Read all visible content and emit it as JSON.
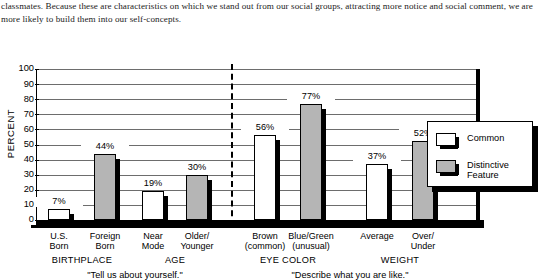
{
  "body_text": "classmates. Because these are characteristics on which we stand out from our social groups, attracting more notice and social comment, we are more likely to build them into our self-concepts.",
  "chart_data": {
    "type": "bar",
    "title": "",
    "xlabel": "",
    "ylabel": "PERCENT",
    "ylim": [
      0,
      100
    ],
    "ytick_labels": [
      "100",
      "90",
      "80",
      "70",
      "60",
      "50",
      "40",
      "30",
      "20",
      "10",
      "0"
    ],
    "grid": true,
    "legend_position": "right",
    "categories": [
      "U.S.\nBorn",
      "Foreign\nBorn",
      "Near\nMode",
      "Older/\nYounger",
      "Brown\n(common)",
      "Blue/Green\n(unusual)",
      "Average",
      "Over/\nUnder"
    ],
    "values": [
      7,
      44,
      19,
      30,
      56,
      77,
      37,
      52
    ],
    "value_labels": [
      "7%",
      "44%",
      "19%",
      "30%",
      "56%",
      "77%",
      "37%",
      "52%"
    ],
    "bar_types": [
      "common",
      "distinct",
      "common",
      "distinct",
      "common",
      "distinct",
      "common",
      "distinct"
    ],
    "groups": [
      {
        "label": "BIRTHPLACE",
        "categories": [
          "U.S. Born",
          "Foreign Born"
        ]
      },
      {
        "label": "AGE",
        "categories": [
          "Near Mode",
          "Older/ Younger"
        ]
      },
      {
        "label": "EYE COLOR",
        "categories": [
          "Brown (common)",
          "Blue/Green (unusual)"
        ]
      },
      {
        "label": "WEIGHT",
        "categories": [
          "Average",
          "Over/ Under"
        ]
      }
    ],
    "sections": [
      {
        "quote": "\"Tell us about yourself.\"",
        "groups": [
          "BIRTHPLACE",
          "AGE"
        ]
      },
      {
        "quote": "\"Describe what you are like.\"",
        "groups": [
          "EYE COLOR",
          "WEIGHT"
        ]
      }
    ],
    "legend": [
      {
        "label": "Common",
        "swatch": "common",
        "color": "#ffffff"
      },
      {
        "label": "Distinctive\nFeature",
        "swatch": "distinct",
        "color": "#b5b5b5"
      }
    ]
  }
}
